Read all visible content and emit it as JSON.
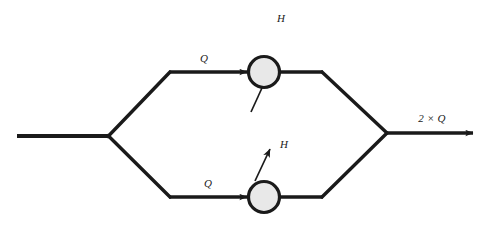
{
  "diagram": {
    "type": "flow-schematic",
    "background_color": "#ffffff",
    "line_color": "#1a1a1a",
    "node_fill_color": "#e8e8e8",
    "node_stroke_color": "#1a1a1a",
    "labels": {
      "inlet_branch_top": "Q",
      "inlet_branch_bottom": "Q",
      "heat_top": "H",
      "heat_bottom": "H",
      "outlet": "2 × Q"
    },
    "nodes": [
      {
        "id": "node-top",
        "label": "",
        "cx": 264,
        "cy": 72,
        "r": 16
      },
      {
        "id": "node-bottom",
        "label": "",
        "cx": 264,
        "cy": 197,
        "r": 16
      }
    ],
    "geometry": {
      "inlet_line": "17,136 108,136",
      "split_point": "108,136",
      "merge_point": "386,133",
      "top_branch": "108,136 170,72 248,72",
      "top_branch_out": "280,72 322,72 386,133",
      "bottom_branch": "108,136 170,197 248,197",
      "bottom_branch_out": "280,197 322,197 386,133",
      "outlet_line": "386,133 473,133",
      "heat_arrow_top": "252,110 268,74",
      "heat_arrow_bottom": "256,180 270,146"
    }
  }
}
